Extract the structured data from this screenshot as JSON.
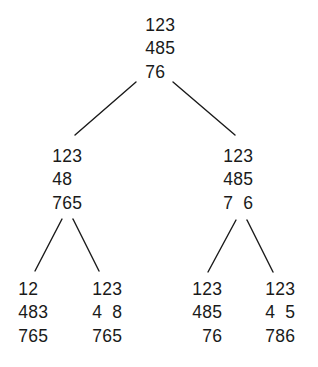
{
  "diagram": {
    "type": "search-tree",
    "edge_color": "#1a1a1a",
    "text_color": "#1a1a1a",
    "background": "#ffffff"
  },
  "nodes": {
    "root": {
      "rows": [
        [
          "1",
          "2",
          "3"
        ],
        [
          "4",
          "8",
          "5"
        ],
        [
          "7",
          "6",
          " "
        ]
      ]
    },
    "left": {
      "rows": [
        [
          "1",
          "2",
          "3"
        ],
        [
          "4",
          "8",
          " "
        ],
        [
          "7",
          "6",
          "5"
        ]
      ]
    },
    "right": {
      "rows": [
        [
          "1",
          "2",
          "3"
        ],
        [
          "4",
          "8",
          "5"
        ],
        [
          "7",
          " ",
          "6"
        ]
      ]
    },
    "left_left": {
      "rows": [
        [
          "1",
          "2",
          " "
        ],
        [
          "4",
          "8",
          "3"
        ],
        [
          "7",
          "6",
          "5"
        ]
      ]
    },
    "left_right": {
      "rows": [
        [
          "1",
          "2",
          "3"
        ],
        [
          "4",
          " ",
          "8"
        ],
        [
          "7",
          "6",
          "5"
        ]
      ]
    },
    "right_left": {
      "rows": [
        [
          "1",
          "2",
          "3"
        ],
        [
          "4",
          "8",
          "5"
        ],
        [
          " ",
          "7",
          "6"
        ]
      ]
    },
    "right_right": {
      "rows": [
        [
          "1",
          "2",
          "3"
        ],
        [
          "4",
          " ",
          "5"
        ],
        [
          "7",
          "8",
          "6"
        ]
      ]
    }
  },
  "edges": [
    {
      "from": "root",
      "to": "left"
    },
    {
      "from": "root",
      "to": "right"
    },
    {
      "from": "left",
      "to": "left_left"
    },
    {
      "from": "left",
      "to": "left_right"
    },
    {
      "from": "right",
      "to": "right_left"
    },
    {
      "from": "right",
      "to": "right_right"
    }
  ]
}
